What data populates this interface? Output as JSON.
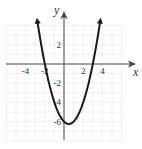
{
  "chart_data": {
    "type": "line",
    "title": "",
    "xlabel": "x",
    "ylabel": "y",
    "function": "y = x^2 - x - 6",
    "xlim": [
      -6,
      6
    ],
    "ylim": [
      -8,
      4
    ],
    "grid": true,
    "x_ticks": [
      -4,
      -2,
      2,
      4
    ],
    "y_ticks": [
      2,
      -2,
      -4,
      -6
    ],
    "x_tick_labels": [
      "-4",
      "-2",
      "2",
      "4"
    ],
    "y_tick_labels": [
      "2",
      "-2",
      "-4",
      "-6"
    ],
    "key_points": {
      "x_intercepts": [
        [
          -2,
          0
        ],
        [
          3,
          0
        ]
      ],
      "y_intercept": [
        0,
        -6
      ],
      "vertex": [
        0.5,
        -6.25
      ]
    },
    "series": [
      {
        "name": "parabola",
        "x": [
          -2.8,
          -2,
          -1,
          0,
          0.5,
          1,
          2,
          3,
          3.8
        ],
        "values": [
          4.64,
          0,
          -4,
          -6,
          -6.25,
          -6,
          -4,
          0,
          4.64
        ]
      }
    ]
  },
  "labels": {
    "x_axis": "x",
    "y_axis": "y"
  }
}
